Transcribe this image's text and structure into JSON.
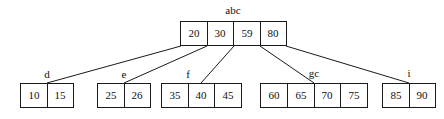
{
  "diagram": {
    "type": "b-plus-tree",
    "title_label": "abc",
    "background_color": "#ffffff",
    "line_color": "#1a1a1a",
    "text_color": "#101010",
    "root": {
      "label": "abc",
      "keys": [
        "20",
        "30",
        "59",
        "80"
      ]
    },
    "leaves": [
      {
        "label": "d",
        "keys": [
          "10",
          "15"
        ]
      },
      {
        "label": "e",
        "keys": [
          "25",
          "26"
        ]
      },
      {
        "label": "f",
        "keys": [
          "35",
          "40",
          "45"
        ]
      },
      {
        "label": "gc",
        "keys": [
          "60",
          "65",
          "70",
          "75"
        ]
      },
      {
        "label": "i",
        "keys": [
          "85",
          "90"
        ]
      }
    ],
    "edges": [
      {
        "from": "root-pointer-0",
        "to": "leaf-d"
      },
      {
        "from": "root-pointer-1",
        "to": "leaf-e"
      },
      {
        "from": "root-pointer-2",
        "to": "leaf-f"
      },
      {
        "from": "root-pointer-3",
        "to": "leaf-gc"
      },
      {
        "from": "root-pointer-4",
        "to": "leaf-i"
      }
    ]
  }
}
